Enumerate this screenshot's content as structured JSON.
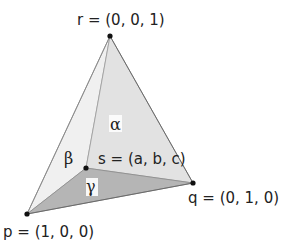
{
  "diagram": {
    "vertices": {
      "r": {
        "label": "r = (0, 0, 1)",
        "x": 110,
        "y": 36
      },
      "p": {
        "label": "p = (1, 0, 0)",
        "x": 27,
        "y": 214
      },
      "q": {
        "label": "q = (0, 1, 0)",
        "x": 193,
        "y": 183
      },
      "s": {
        "label": "s = (a, b, c)",
        "x": 86,
        "y": 168
      }
    },
    "regions": {
      "alpha": {
        "label": "α",
        "triangle": "r-s-q",
        "fill": "#e2e2e2"
      },
      "beta": {
        "label": "β",
        "triangle": "r-p-s",
        "fill": "#f0f0f0"
      },
      "gamma": {
        "label": "γ",
        "triangle": "p-q-s",
        "fill": "#b5b5b5"
      }
    },
    "colors": {
      "edge": "#8a8a8a",
      "point": "#111111",
      "text": "#222222"
    }
  }
}
